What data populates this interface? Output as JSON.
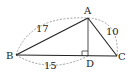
{
  "diagram": {
    "type": "geometry",
    "points": {
      "A": {
        "label": "A",
        "x": 88,
        "y": 18
      },
      "B": {
        "label": "B",
        "x": 16,
        "y": 55
      },
      "C": {
        "label": "C",
        "x": 117,
        "y": 56
      },
      "D": {
        "label": "D",
        "x": 88,
        "y": 56
      }
    },
    "segments": [
      {
        "from": "A",
        "to": "B"
      },
      {
        "from": "A",
        "to": "C"
      },
      {
        "from": "B",
        "to": "C"
      },
      {
        "from": "A",
        "to": "D"
      }
    ],
    "right_angle_at": "D",
    "lengths": {
      "AB": "17",
      "AC": "10",
      "BD": "15"
    },
    "colors": {
      "line": "#222222",
      "dashed": "#888888"
    }
  }
}
